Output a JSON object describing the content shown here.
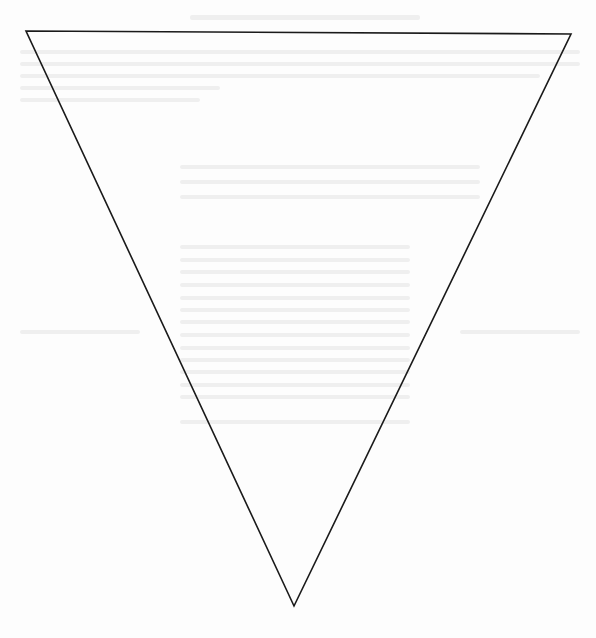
{
  "diagram": {
    "shape": "inverted-triangle",
    "stroke_color": "#1a1a1a",
    "fill_color": "#ffffff",
    "stroke_width": 1.6,
    "vertices": {
      "top_left": [
        26,
        31
      ],
      "top_right": [
        571,
        34
      ],
      "bottom": [
        294,
        606
      ]
    }
  },
  "page": {
    "background": "#fdfdfd",
    "bleed_through_color": "#ececec"
  }
}
